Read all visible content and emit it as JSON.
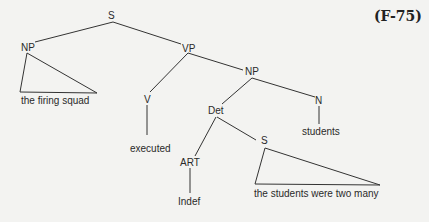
{
  "example_label": "(F-75)",
  "tree": {
    "nodes": {
      "s_root": "S",
      "np_subj": "NP",
      "vp": "VP",
      "v": "V",
      "np_obj": "NP",
      "det": "Det",
      "n": "N",
      "art": "ART",
      "s_emb": "S"
    },
    "leaves": {
      "subject": "the firing squad",
      "verb": "executed",
      "noun": "students",
      "article": "Indef",
      "embedded_clause": "the students were two many"
    }
  },
  "colors": {
    "background": "#f3f3f1",
    "ink": "#333333"
  }
}
